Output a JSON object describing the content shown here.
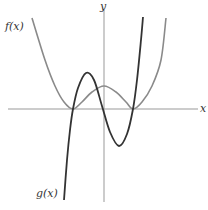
{
  "chart_data": {
    "type": "line",
    "title": "",
    "xlabel": "x",
    "ylabel": "y",
    "grid": false,
    "series": [
      {
        "name": "f(x)",
        "color": "#8a8a8a",
        "description": "even quartic (W shape), double roots at two points symmetric about y-axis, local max at x=0",
        "points_px": [
          [
            32,
            18
          ],
          [
            45,
            60
          ],
          [
            55,
            86
          ],
          [
            64,
            102
          ],
          [
            73,
            109
          ],
          [
            82,
            102
          ],
          [
            92,
            92
          ],
          [
            104,
            86
          ],
          [
            116,
            92
          ],
          [
            126,
            102
          ],
          [
            133,
            109
          ],
          [
            142,
            102
          ],
          [
            152,
            86
          ],
          [
            161,
            60
          ],
          [
            166,
            18
          ]
        ]
      },
      {
        "name": "g(x)",
        "color": "#333333",
        "description": "cubic-like curve rising from lower left, local max left of y-axis, local min right of y-axis, rising steeply to upper right",
        "points_px": [
          [
            64,
            200
          ],
          [
            67,
            160
          ],
          [
            70,
            130
          ],
          [
            73,
            109
          ],
          [
            78,
            88
          ],
          [
            86,
            73
          ],
          [
            94,
            80
          ],
          [
            102,
            106
          ],
          [
            110,
            132
          ],
          [
            119,
            146
          ],
          [
            127,
            134
          ],
          [
            133,
            109
          ],
          [
            137,
            80
          ],
          [
            141,
            40
          ],
          [
            143,
            17
          ]
        ]
      }
    ],
    "axis_px": {
      "x_axis_y": 109,
      "y_axis_x": 104,
      "x_start": 8,
      "x_end": 198,
      "y_start": 10,
      "y_end": 202
    }
  },
  "labels": {
    "x_axis": "x",
    "y_axis": "y",
    "f_label": "f(x)",
    "g_label": "g(x)"
  }
}
